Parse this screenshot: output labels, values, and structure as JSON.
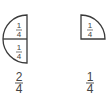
{
  "figures": [
    {
      "name": "half-circle",
      "parts": [
        {
          "numerator": "1",
          "denominator": "4"
        },
        {
          "numerator": "1",
          "denominator": "4"
        }
      ],
      "caption": {
        "numerator": "2",
        "denominator": "4"
      }
    },
    {
      "name": "quarter-circle",
      "parts": [
        {
          "numerator": "1",
          "denominator": "4"
        }
      ],
      "caption": {
        "numerator": "1",
        "denominator": "4"
      }
    }
  ],
  "colors": {
    "stroke": "#3a3a3a",
    "text": "#444444"
  }
}
